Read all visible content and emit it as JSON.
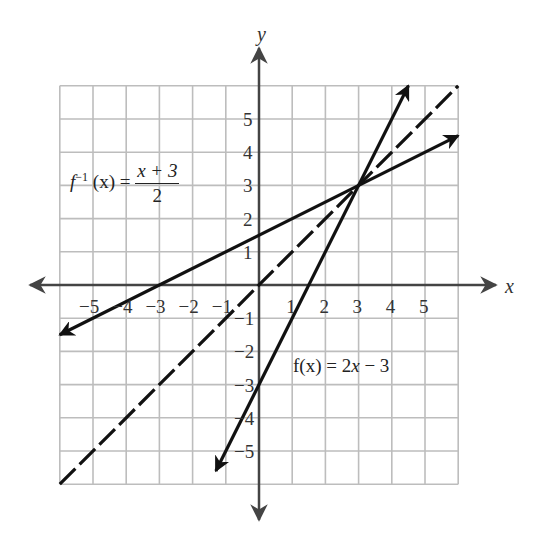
{
  "chart_data": {
    "type": "line",
    "title": "",
    "xlabel": "x",
    "ylabel": "y",
    "xlim": [
      -6,
      6
    ],
    "ylim": [
      -6,
      6
    ],
    "grid": true,
    "x_ticks": [
      "-5",
      "-4",
      "-3",
      "-2",
      "-1",
      "1",
      "2",
      "3",
      "4",
      "5"
    ],
    "y_ticks": [
      "5",
      "4",
      "3",
      "2",
      "1",
      "-1",
      "-2",
      "-3",
      "-4",
      "-5"
    ],
    "series": [
      {
        "name": "f(x) = 2x - 3",
        "style": "solid-arrows",
        "slope": 2,
        "intercept": -3,
        "x": [
          -1.3,
          4.5
        ],
        "y": [
          -5.6,
          6.0
        ]
      },
      {
        "name": "f^-1(x) = (x + 3)/2",
        "style": "solid-arrows",
        "slope": 0.5,
        "intercept": 1.5,
        "x": [
          -6,
          6
        ],
        "y": [
          -1.5,
          4.5
        ]
      },
      {
        "name": "y = x",
        "style": "dashed",
        "slope": 1,
        "intercept": 0,
        "x": [
          -6,
          6
        ],
        "y": [
          -6,
          6
        ]
      }
    ],
    "annotations": [
      {
        "text": "f(x) = 2x − 3",
        "x": 1.1,
        "y": -2.5
      },
      {
        "text": "f⁻¹(x) = (x + 3)/2",
        "x": -5.7,
        "y": 3
      },
      {
        "text": "intersection",
        "x": 3,
        "y": 3
      }
    ]
  },
  "axes": {
    "x_label": "x",
    "y_label": "y",
    "x_tick_labels": [
      {
        "text": "−5",
        "v": -5
      },
      {
        "text": "−4",
        "v": -4
      },
      {
        "text": "−3",
        "v": -3
      },
      {
        "text": "−2",
        "v": -2
      },
      {
        "text": "−1",
        "v": -1
      },
      {
        "text": "1",
        "v": 1
      },
      {
        "text": "2",
        "v": 2
      },
      {
        "text": "3",
        "v": 3
      },
      {
        "text": "4",
        "v": 4
      },
      {
        "text": "5",
        "v": 5
      }
    ],
    "y_tick_labels": [
      {
        "text": "5",
        "v": 5
      },
      {
        "text": "4",
        "v": 4
      },
      {
        "text": "3",
        "v": 3
      },
      {
        "text": "2",
        "v": 2
      },
      {
        "text": "1",
        "v": 1
      },
      {
        "text": "−1",
        "v": -1
      },
      {
        "text": "−2",
        "v": -2
      },
      {
        "text": "−3",
        "v": -3
      },
      {
        "text": "−4",
        "v": -4
      },
      {
        "text": "−5",
        "v": -5
      }
    ]
  },
  "labels": {
    "f_prefix": "f(x) = 2",
    "f_var": "x",
    "f_suffix": " − 3",
    "finv_f": "f",
    "finv_sup": "−1",
    "finv_arg": " (x) =",
    "finv_num": "x + 3",
    "finv_den": "2"
  },
  "colors": {
    "grid": "#bdbdbd",
    "axis": "#444444",
    "line": "#111111",
    "text": "#333333"
  }
}
